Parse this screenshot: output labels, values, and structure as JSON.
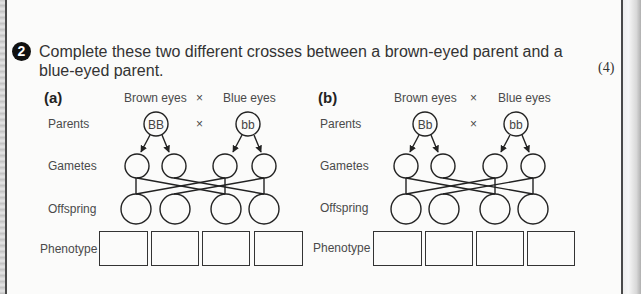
{
  "question": {
    "number": "2",
    "text": "Complete these two different crosses between a brown-eyed parent and a blue-eyed parent.",
    "marks": "(4)"
  },
  "row_labels": {
    "parents": "Parents",
    "gametes": "Gametes",
    "offspring": "Offspring",
    "phenotype": "Phenotype"
  },
  "crosses": [
    {
      "part": "(a)",
      "parent1_label": "Brown eyes",
      "cross_symbol": "×",
      "parent2_label": "Blue eyes",
      "parent1_genotype": "BB",
      "parent2_genotype": "bb",
      "gametes": [
        "",
        "",
        "",
        ""
      ],
      "offspring": [
        "",
        "",
        "",
        ""
      ],
      "phenotypes": [
        "",
        "",
        "",
        ""
      ]
    },
    {
      "part": "(b)",
      "parent1_label": "Brown eyes",
      "cross_symbol": "×",
      "parent2_label": "Blue eyes",
      "parent1_genotype": "Bb",
      "parent2_genotype": "bb",
      "gametes": [
        "",
        "",
        "",
        ""
      ],
      "offspring": [
        "",
        "",
        "",
        ""
      ],
      "phenotypes": [
        "",
        "",
        "",
        ""
      ]
    }
  ]
}
